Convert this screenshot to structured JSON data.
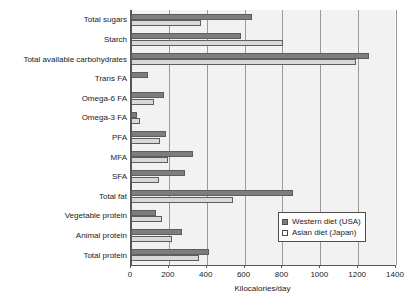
{
  "chart_data": {
    "type": "bar",
    "orientation": "horizontal",
    "title": "",
    "xlabel": "Kilocalories/day",
    "ylabel": "",
    "xlim": [
      0,
      1400
    ],
    "xticks": [
      0,
      200,
      400,
      600,
      800,
      1000,
      1200,
      1400
    ],
    "xtick_labels": [
      "0",
      "200",
      "400",
      "600",
      "800",
      "1000",
      "1200",
      "1400"
    ],
    "grid": "vertical",
    "legend_position": "lower right",
    "categories": [
      "Total sugars",
      "Starch",
      "Total available carbohydrates",
      "Trans FA",
      "Omega-6 FA",
      "Omega-3 FA",
      "PFA",
      "MFA",
      "SFA",
      "Total fat",
      "Vegetable protein",
      "Animal protein",
      "Total protein"
    ],
    "series": [
      {
        "name": "Western diet (USA)",
        "color": "#7d7d7d",
        "values": [
          640,
          580,
          1255,
          90,
          175,
          30,
          185,
          330,
          285,
          855,
          130,
          270,
          410
        ]
      },
      {
        "name": "Asian diet (Japan)",
        "color": "#d9d9d9",
        "values": [
          370,
          805,
          1190,
          0,
          120,
          50,
          155,
          195,
          150,
          540,
          165,
          215,
          360
        ]
      }
    ]
  },
  "legend": {
    "entries": [
      {
        "label": "Western diet (USA)"
      },
      {
        "label": "Asian diet (Japan)"
      }
    ]
  }
}
